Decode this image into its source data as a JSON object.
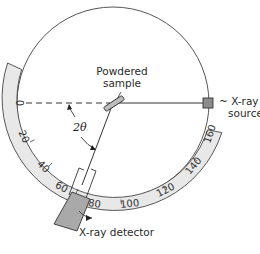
{
  "figure": {
    "labels": {
      "sample_line1": "Powdered",
      "sample_line2": "sample",
      "source_line1": "~ X-ray",
      "source_line2": "source",
      "detector": "X-ray detector",
      "angle": "2θ",
      "caption": "(a)"
    },
    "scale": {
      "ticks": [
        "0",
        "20",
        "40",
        "60",
        "80",
        "100",
        "120",
        "140",
        "160"
      ]
    },
    "colors": {
      "scale_fill": "#e6e6e6",
      "detector_fill": "#a9a9a9",
      "source_fill": "#8c8c8c",
      "line": "#3a3a3a"
    }
  }
}
